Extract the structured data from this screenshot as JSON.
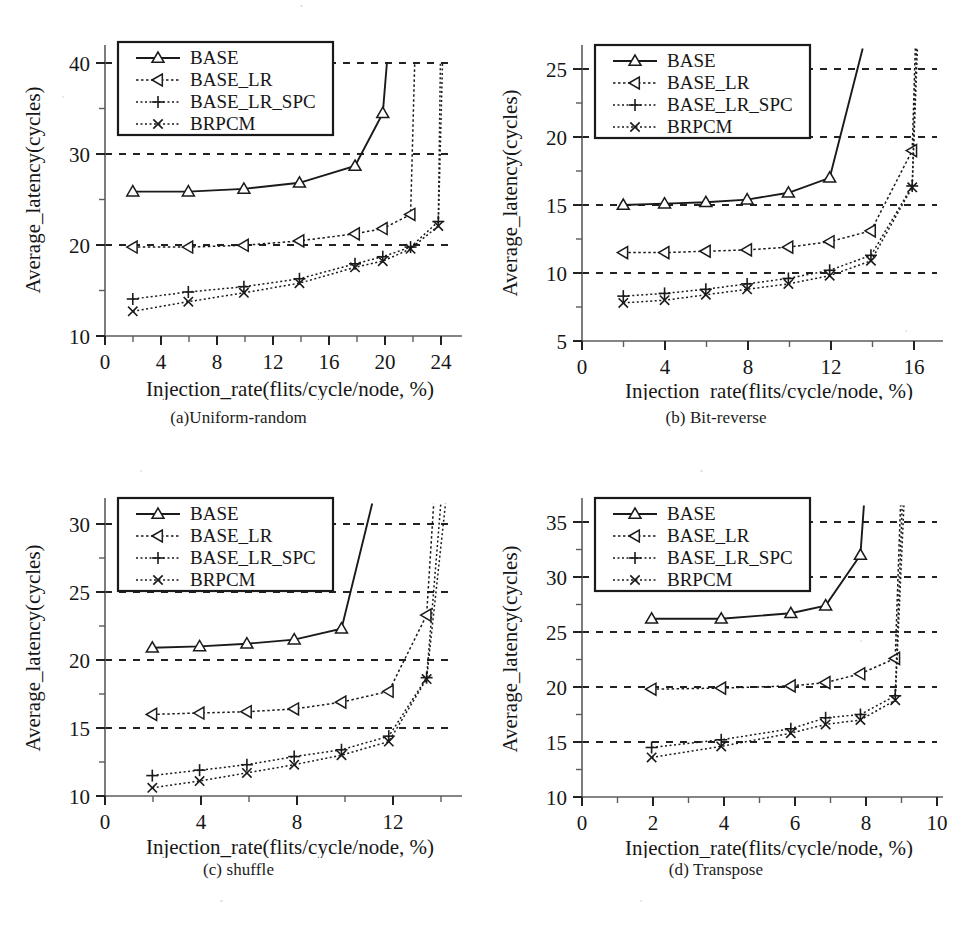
{
  "figure": {
    "panels": [
      {
        "id": "a",
        "caption": "(a)Uniform-random",
        "xlabel": "Injection_rate(flits/cycle/node, %)",
        "ylabel": "Average_latency(cycles)"
      },
      {
        "id": "b",
        "caption": "(b) Bit-reverse",
        "xlabel": "Injection_rate(flits/cycle/node, %)",
        "ylabel": "Average_latency(cycles)"
      },
      {
        "id": "c",
        "caption": "(c) shuffle",
        "xlabel": "Injection_rate(flits/cycle/node, %)",
        "ylabel": "Average_latency(cycles)"
      },
      {
        "id": "d",
        "caption": "(d) Transpose",
        "xlabel": "Injection_rate(flits/cycle/node, %)",
        "ylabel": "Average_latency(cycles)"
      }
    ],
    "legend_labels": [
      "BASE",
      "BASE_LR",
      "BASE_LR_SPC",
      "BRPCM"
    ],
    "markers": [
      "triangle-up",
      "triangle-left",
      "plus",
      "cross"
    ]
  },
  "chart_data": [
    {
      "type": "line",
      "title": "(a)Uniform-random",
      "xlabel": "Injection_rate(flits/cycle/node, %)",
      "ylabel": "Average_latency(cycles)",
      "xlim": [
        0,
        25.2
      ],
      "ylim": [
        10,
        41
      ],
      "xticks": [
        0,
        4,
        8,
        12,
        16,
        20,
        24
      ],
      "xminorticks": [
        2,
        6,
        10,
        14,
        18,
        22
      ],
      "yticks": [
        10,
        20,
        30,
        40
      ],
      "yminorticks": [
        15,
        25,
        35
      ],
      "grid": "horizontal-dashed at 20, 30, 40",
      "legend_position": "upper-left",
      "series": [
        {
          "name": "BASE",
          "marker": "triangle-up",
          "x": [
            2,
            6,
            10,
            14,
            18,
            20,
            20.3
          ],
          "y": [
            26.4,
            26.4,
            26.7,
            27.4,
            29.3,
            35.3,
            41.0
          ]
        },
        {
          "name": "BASE_LR",
          "marker": "triangle-left",
          "x": [
            2,
            6,
            10,
            14,
            18,
            20,
            22,
            22.3
          ],
          "y": [
            20.1,
            20.1,
            20.3,
            20.8,
            21.6,
            22.2,
            23.8,
            41.0
          ]
        },
        {
          "name": "BASE_LR_SPC",
          "marker": "plus",
          "x": [
            2,
            6,
            10,
            14,
            18,
            20,
            22,
            24,
            24.15
          ],
          "y": [
            14.2,
            15.0,
            15.6,
            16.5,
            18.2,
            19.0,
            20.1,
            23.0,
            41.0
          ]
        },
        {
          "name": "BRPCM",
          "marker": "cross",
          "x": [
            2,
            6,
            10,
            14,
            18,
            20,
            22,
            24,
            24.3
          ],
          "y": [
            12.8,
            13.9,
            14.9,
            16.0,
            17.8,
            18.5,
            19.9,
            22.5,
            41.0
          ]
        }
      ]
    },
    {
      "type": "line",
      "title": "(b) Bit-reverse",
      "xlabel": "Injection_rate(flits/cycle/node, %)",
      "ylabel": "Average_latency(cycles)",
      "xlim": [
        0,
        17.2
      ],
      "ylim": [
        5,
        26.5
      ],
      "xticks": [
        0,
        4,
        8,
        12,
        16
      ],
      "xminorticks": [
        2,
        6,
        10,
        14
      ],
      "yticks": [
        5,
        10,
        15,
        20,
        25
      ],
      "grid": "horizontal-dashed at 10, 15, 20, 25",
      "legend_position": "upper-left",
      "series": [
        {
          "name": "BASE",
          "marker": "triangle-up",
          "x": [
            2,
            4,
            6,
            8,
            10,
            12,
            13.6
          ],
          "y": [
            15.0,
            15.1,
            15.2,
            15.4,
            15.9,
            17.0,
            26.5
          ]
        },
        {
          "name": "BASE_LR",
          "marker": "triangle-left",
          "x": [
            2,
            4,
            6,
            8,
            10,
            12,
            14,
            16,
            16.15
          ],
          "y": [
            11.5,
            11.5,
            11.6,
            11.7,
            11.9,
            12.3,
            13.1,
            19.0,
            26.5
          ]
        },
        {
          "name": "BASE_LR_SPC",
          "marker": "plus",
          "x": [
            2,
            4,
            6,
            8,
            10,
            12,
            14,
            16,
            16.2
          ],
          "y": [
            8.3,
            8.5,
            8.8,
            9.2,
            9.6,
            10.2,
            11.3,
            16.4,
            26.5
          ]
        },
        {
          "name": "BRPCM",
          "marker": "cross",
          "x": [
            2,
            4,
            6,
            8,
            10,
            12,
            14,
            16,
            16.25
          ],
          "y": [
            7.8,
            8.0,
            8.4,
            8.8,
            9.2,
            9.8,
            10.9,
            16.3,
            26.5
          ]
        }
      ]
    },
    {
      "type": "line",
      "title": "(c) shuffle",
      "xlabel": "Injection_rate(flits/cycle/node, %)",
      "ylabel": "Average_latency(cycles)",
      "xlim": [
        0,
        14.8
      ],
      "ylim": [
        10,
        31.5
      ],
      "xticks": [
        0,
        4,
        8,
        12
      ],
      "xminorticks": [
        2,
        6,
        10,
        14
      ],
      "yticks": [
        10,
        15,
        20,
        25,
        30
      ],
      "grid": "horizontal-dashed at 15, 20, 25, 30",
      "legend_position": "upper-left",
      "series": [
        {
          "name": "BASE",
          "marker": "triangle-up",
          "x": [
            2,
            4,
            6,
            8,
            10,
            11.3
          ],
          "y": [
            20.9,
            21.0,
            21.2,
            21.5,
            22.3,
            31.5
          ]
        },
        {
          "name": "BASE_LR",
          "marker": "triangle-left",
          "x": [
            2,
            4,
            6,
            8,
            10,
            12,
            13.6,
            13.9
          ],
          "y": [
            16.0,
            16.1,
            16.2,
            16.4,
            16.9,
            17.7,
            23.3,
            31.5
          ]
        },
        {
          "name": "BASE_LR_SPC",
          "marker": "plus",
          "x": [
            2,
            4,
            6,
            8,
            10,
            12,
            13.6,
            14.2
          ],
          "y": [
            11.5,
            11.9,
            12.3,
            12.9,
            13.4,
            14.4,
            18.7,
            31.5
          ]
        },
        {
          "name": "BRPCM",
          "marker": "cross",
          "x": [
            2,
            4,
            6,
            8,
            10,
            12,
            13.6,
            14.4
          ],
          "y": [
            10.6,
            11.1,
            11.7,
            12.3,
            13.0,
            14.0,
            18.6,
            31.5
          ]
        }
      ]
    },
    {
      "type": "line",
      "title": "(d) Transpose",
      "xlabel": "Injection_rate(flits/cycle/node, %)",
      "ylabel": "Average_latency(cycles)",
      "xlim": [
        0,
        10.2
      ],
      "ylim": [
        10,
        36.5
      ],
      "xticks": [
        0,
        2,
        4,
        6,
        8,
        10
      ],
      "xminorticks": [
        1,
        3,
        5,
        7,
        9
      ],
      "yticks": [
        10,
        15,
        20,
        25,
        30,
        35
      ],
      "grid": "horizontal-dashed at 15, 20, 25, 30, 35",
      "legend_position": "upper-left",
      "series": [
        {
          "name": "BASE",
          "marker": "triangle-up",
          "x": [
            2,
            4,
            6,
            7,
            8,
            8.1
          ],
          "y": [
            26.2,
            26.2,
            26.7,
            27.4,
            32.0,
            36.5
          ]
        },
        {
          "name": "BASE_LR",
          "marker": "triangle-left",
          "x": [
            2,
            4,
            6,
            7,
            8,
            9,
            9.15
          ],
          "y": [
            19.8,
            19.9,
            20.1,
            20.4,
            21.2,
            22.6,
            36.5
          ]
        },
        {
          "name": "BASE_LR_SPC",
          "marker": "plus",
          "x": [
            2,
            4,
            6,
            7,
            8,
            9,
            9.2
          ],
          "y": [
            14.5,
            15.2,
            16.2,
            17.2,
            17.5,
            19.2,
            36.5
          ]
        },
        {
          "name": "BRPCM",
          "marker": "cross",
          "x": [
            2,
            4,
            6,
            7,
            8,
            9,
            9.25
          ],
          "y": [
            13.6,
            14.6,
            15.8,
            16.6,
            17.0,
            18.8,
            36.5
          ]
        }
      ]
    }
  ]
}
